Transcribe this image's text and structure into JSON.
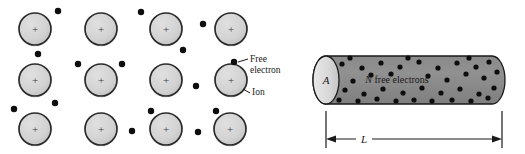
{
  "figure": {
    "panels": [
      {
        "id": "lattice",
        "name": "ion-lattice-panel"
      },
      {
        "id": "cylinder",
        "name": "conductor-cylinder-panel"
      }
    ]
  },
  "colors": {
    "ion_fill": "#d2d2d2",
    "ion_stroke": "#2b2b2b",
    "electron_fill": "#0d0d0d",
    "cylinder_body_fill": "#8c8c8c",
    "cylinder_face_fill": "#d8d8d8",
    "outline": "#1a1a1a",
    "background": "#ffffff",
    "text": "#1a1a1a"
  },
  "lattice": {
    "ion_symbol": "+",
    "ion_radius": 16,
    "electron_radius": 3.2,
    "ions": [
      {
        "cx": 35,
        "cy": 29
      },
      {
        "cx": 101,
        "cy": 29
      },
      {
        "cx": 166,
        "cy": 29
      },
      {
        "cx": 231,
        "cy": 29
      },
      {
        "cx": 35,
        "cy": 80
      },
      {
        "cx": 101,
        "cy": 80
      },
      {
        "cx": 166,
        "cy": 80
      },
      {
        "cx": 231,
        "cy": 80
      },
      {
        "cx": 35,
        "cy": 129
      },
      {
        "cx": 101,
        "cy": 129
      },
      {
        "cx": 166,
        "cy": 129
      },
      {
        "cx": 230,
        "cy": 129
      }
    ],
    "electrons": [
      {
        "cx": 58,
        "cy": 11
      },
      {
        "cx": 141,
        "cy": 12
      },
      {
        "cx": 203,
        "cy": 24
      },
      {
        "cx": 38,
        "cy": 54
      },
      {
        "cx": 183,
        "cy": 50
      },
      {
        "cx": 78,
        "cy": 64
      },
      {
        "cx": 122,
        "cy": 64
      },
      {
        "cx": 196,
        "cy": 86
      },
      {
        "cx": 234,
        "cy": 62
      },
      {
        "cx": 14,
        "cy": 109
      },
      {
        "cx": 55,
        "cy": 103
      },
      {
        "cx": 151,
        "cy": 111
      },
      {
        "cx": 216,
        "cy": 111
      },
      {
        "cx": 132,
        "cy": 131
      },
      {
        "cx": 198,
        "cy": 132
      }
    ],
    "callouts": [
      {
        "name": "free-electron-callout",
        "lines": [
          "Free",
          "electron"
        ],
        "text_x": 250,
        "text_y": 62,
        "leader": {
          "x1": 238,
          "y1": 62,
          "x2": 248,
          "y2": 59
        }
      },
      {
        "name": "ion-callout",
        "lines": [
          "Ion"
        ],
        "text_x": 252,
        "text_y": 95,
        "leader": {
          "x1": 243,
          "y1": 89,
          "x2": 250,
          "y2": 93
        }
      }
    ]
  },
  "cylinder": {
    "area_label": "A",
    "interior_label_italic": "N",
    "interior_label_rest": " free electrons",
    "interior_label_full": "N free electrons",
    "interior_label_x": 397,
    "interior_label_y": 83,
    "length_label": "L",
    "geometry": {
      "left_face_cx": 326,
      "left_face_cy": 80,
      "face_rx": 13,
      "face_ry": 24,
      "body_right_x": 492,
      "top_y": 56,
      "bottom_y": 104,
      "dim_left_x": 326,
      "dim_right_x": 502,
      "dim_y": 139,
      "ext_top_y": 111
    },
    "electrons": [
      {
        "cx": 342,
        "cy": 64
      },
      {
        "cx": 362,
        "cy": 68
      },
      {
        "cx": 381,
        "cy": 63
      },
      {
        "cx": 400,
        "cy": 67
      },
      {
        "cx": 419,
        "cy": 62
      },
      {
        "cx": 438,
        "cy": 68
      },
      {
        "cx": 457,
        "cy": 63
      },
      {
        "cx": 476,
        "cy": 67
      },
      {
        "cx": 489,
        "cy": 62
      },
      {
        "cx": 336,
        "cy": 77
      },
      {
        "cx": 353,
        "cy": 81
      },
      {
        "cx": 371,
        "cy": 75
      },
      {
        "cx": 391,
        "cy": 74
      },
      {
        "cx": 428,
        "cy": 76
      },
      {
        "cx": 447,
        "cy": 80
      },
      {
        "cx": 466,
        "cy": 74
      },
      {
        "cx": 484,
        "cy": 78
      },
      {
        "cx": 497,
        "cy": 72
      },
      {
        "cx": 345,
        "cy": 90
      },
      {
        "cx": 364,
        "cy": 94
      },
      {
        "cx": 383,
        "cy": 89
      },
      {
        "cx": 403,
        "cy": 93
      },
      {
        "cx": 422,
        "cy": 88
      },
      {
        "cx": 441,
        "cy": 93
      },
      {
        "cx": 460,
        "cy": 89
      },
      {
        "cx": 479,
        "cy": 94
      },
      {
        "cx": 494,
        "cy": 88
      },
      {
        "cx": 339,
        "cy": 100
      },
      {
        "cx": 358,
        "cy": 101
      },
      {
        "cx": 377,
        "cy": 99
      },
      {
        "cx": 414,
        "cy": 100
      },
      {
        "cx": 452,
        "cy": 100
      },
      {
        "cx": 471,
        "cy": 101
      },
      {
        "cx": 488,
        "cy": 98
      },
      {
        "cx": 408,
        "cy": 58
      },
      {
        "cx": 350,
        "cy": 58
      },
      {
        "cx": 432,
        "cy": 101
      },
      {
        "cx": 396,
        "cy": 101
      },
      {
        "cx": 469,
        "cy": 58
      }
    ],
    "electron_radius": 2.6
  }
}
